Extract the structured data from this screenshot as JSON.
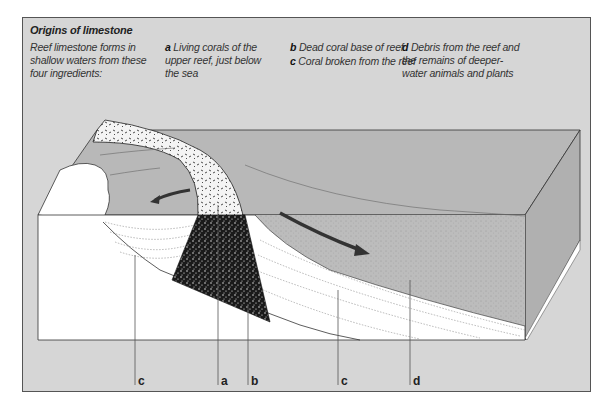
{
  "figure": {
    "title": "Origins of limestone",
    "intro": "Reef limestone forms in shallow waters from these four ingredients:",
    "legend": [
      {
        "key": "a",
        "text": "Living corals of the upper reef, just below the sea"
      },
      {
        "key": "b",
        "text": "Dead coral base of reef"
      },
      {
        "key": "c",
        "text": "Coral broken from the reef"
      },
      {
        "key": "d",
        "text": "Debris from the reef and the remains of deeper-water animals and plants"
      }
    ],
    "callouts": [
      {
        "key": "c",
        "x": 135
      },
      {
        "key": "a",
        "x": 218
      },
      {
        "key": "b",
        "x": 248
      },
      {
        "key": "c",
        "x": 338
      },
      {
        "key": "d",
        "x": 410
      }
    ]
  },
  "colors": {
    "frame_bg": "#d6d6d6",
    "sea": "#b8b8b8",
    "sediment": "#ffffff",
    "dead_coral": "#1a1a1a",
    "arrow": "#333333"
  }
}
